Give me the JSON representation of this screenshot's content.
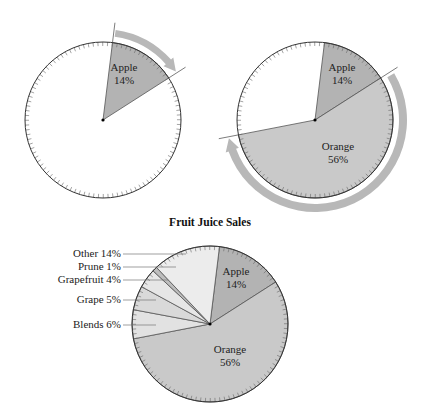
{
  "figure": {
    "title": "Fruit Juice Sales",
    "panel1": {
      "labels": [
        {
          "name": "Apple",
          "pct": "14%"
        }
      ]
    },
    "panel2": {
      "labels": [
        {
          "name": "Apple",
          "pct": "14%"
        },
        {
          "name": "Orange",
          "pct": "56%"
        }
      ]
    },
    "panel3": {
      "inside_labels": [
        {
          "name": "Apple",
          "pct": "14%"
        },
        {
          "name": "Orange",
          "pct": "56%"
        }
      ],
      "callouts": [
        "Other 14%",
        "Prune 1%",
        "Grapefruit 4%",
        "Grape 5%",
        "Blends 6%"
      ]
    }
  },
  "colors": {
    "apple": "#b3b3b3",
    "orange": "#c9c9c9",
    "blends": "#e2e2e2",
    "grape": "#d9d9d9",
    "grapefruit": "#e6e6e6",
    "prune": "#bdbdbd",
    "other": "#ececec",
    "arrow": "#b8b8b8",
    "outline": "#333333"
  },
  "chart_data": {
    "type": "pie",
    "title": "Fruit Juice Sales",
    "categories": [
      "Apple",
      "Orange",
      "Blends",
      "Grape",
      "Grapefruit",
      "Prune",
      "Other"
    ],
    "values": [
      14,
      56,
      6,
      5,
      4,
      1,
      14
    ],
    "unit": "%",
    "start_angle_deg": 7,
    "direction": "clockwise",
    "panels": [
      {
        "panel": 1,
        "shaded": [
          "Apple"
        ],
        "arrow_spans": "Apple"
      },
      {
        "panel": 2,
        "shaded": [
          "Apple",
          "Orange"
        ],
        "arrow_spans": "Orange"
      },
      {
        "panel": 3,
        "shaded": [
          "Apple",
          "Orange",
          "Blends",
          "Grape",
          "Grapefruit",
          "Prune",
          "Other"
        ],
        "title": "Fruit Juice Sales"
      }
    ]
  }
}
